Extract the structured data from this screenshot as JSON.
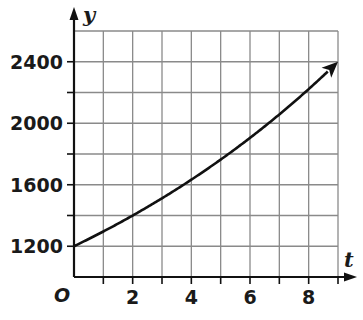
{
  "chart_data": {
    "type": "line",
    "title": "",
    "xlabel": "t",
    "ylabel": "y",
    "origin_label": "O",
    "xlim": [
      0,
      9
    ],
    "ylim": [
      1000,
      2600
    ],
    "grid": true,
    "x_grid_step": 1,
    "y_grid_step": 200,
    "x_ticks": [
      2,
      4,
      6,
      8
    ],
    "x_tick_labels": [
      "2",
      "4",
      "6",
      "8"
    ],
    "y_ticks": [
      1200,
      1600,
      2000,
      2400
    ],
    "y_tick_labels": [
      "1200",
      "1600",
      "2000",
      "2400"
    ],
    "legend": null,
    "series": [
      {
        "name": "y",
        "style": "solid black curve with arrowhead at end",
        "x": [
          0,
          1,
          2,
          3,
          4,
          5,
          6,
          7,
          8,
          9
        ],
        "y": [
          1200,
          1296,
          1400,
          1512,
          1633,
          1763,
          1904,
          2057,
          2221,
          2400
        ]
      }
    ],
    "colors": {
      "curve": "#111111",
      "grid": "#8a8a8a",
      "axis": "#111111"
    }
  }
}
